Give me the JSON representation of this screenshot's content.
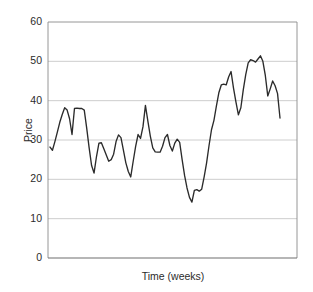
{
  "chart_data": {
    "type": "line",
    "title": "",
    "xlabel": "Time (weeks)",
    "ylabel": "Price",
    "ylim": [
      0,
      60
    ],
    "yticks": [
      0,
      10,
      20,
      30,
      40,
      50,
      60
    ],
    "ytick_labels": [
      "0",
      "10",
      "20",
      "30",
      "40",
      "50",
      "60"
    ],
    "xlim": [
      1,
      100
    ],
    "xticks": [],
    "xtick_labels": [],
    "grid": "horizontal",
    "legend": "none",
    "line_color": "#2b2b2b",
    "grid_color": "#c8c8c8",
    "axis_color": "#8a8a8a",
    "background_color": "#ffffff",
    "series": [
      {
        "name": "Price",
        "values": [
          28.2,
          27.4,
          29.6,
          32.0,
          34.5,
          36.5,
          38.2,
          37.6,
          35.4,
          31.4,
          38.0,
          38.1,
          38.0,
          38.0,
          37.6,
          33.0,
          28.0,
          23.5,
          21.6,
          25.8,
          29.2,
          29.3,
          27.8,
          26.2,
          24.6,
          25.0,
          26.4,
          29.6,
          31.3,
          30.6,
          27.4,
          24.2,
          22.0,
          20.6,
          24.6,
          28.4,
          31.4,
          30.4,
          33.4,
          38.8,
          34.8,
          31.0,
          28.0,
          27.0,
          26.9,
          26.9,
          28.4,
          30.6,
          31.4,
          28.6,
          27.2,
          29.2,
          30.2,
          29.4,
          25.0,
          21.0,
          17.8,
          15.4,
          14.2,
          17.2,
          17.4,
          17.0,
          17.5,
          20.6,
          24.2,
          28.6,
          32.6,
          35.0,
          38.6,
          42.0,
          44.0,
          44.2,
          44.0,
          46.0,
          47.4,
          43.2,
          39.6,
          36.4,
          38.2,
          42.8,
          46.6,
          49.6,
          50.4,
          50.2,
          49.8,
          50.6,
          51.4,
          50.0,
          46.4,
          41.2,
          43.0,
          45.0,
          43.8,
          41.8,
          35.6
        ]
      }
    ]
  },
  "axes": {
    "y_title": "Price",
    "x_title": "Time (weeks)"
  }
}
